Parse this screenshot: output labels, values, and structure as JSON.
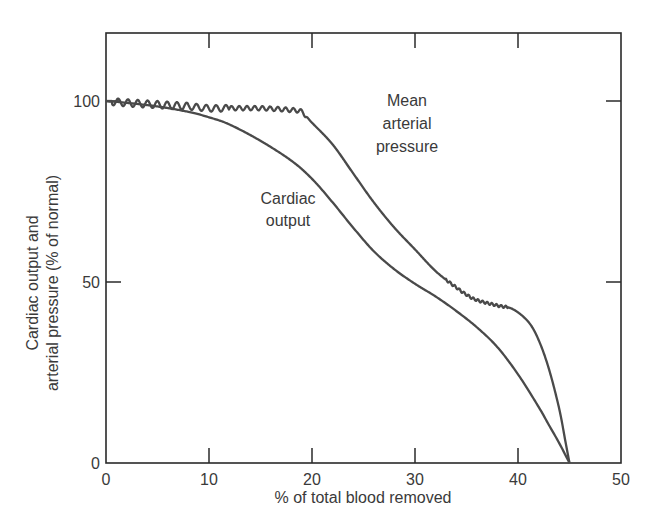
{
  "chart_data": {
    "type": "line",
    "title": "",
    "xlabel": "% of total blood removed",
    "ylabel": [
      "Cardiac output and",
      "arterial pressure (% of normal)"
    ],
    "xlim": [
      0,
      50
    ],
    "ylim": [
      0,
      120
    ],
    "x_ticks": [
      0,
      10,
      20,
      30,
      40,
      50
    ],
    "y_ticks": [
      0,
      50,
      100
    ],
    "x_tick_labels": [
      "0",
      "10",
      "20",
      "30",
      "40",
      "50"
    ],
    "y_tick_labels": [
      "0",
      "50",
      "100"
    ],
    "grid": false,
    "legend": "none (curves labeled directly)",
    "series": [
      {
        "name": "Mean arterial pressure",
        "label_lines": [
          "Mean",
          "arterial",
          "pressure"
        ],
        "style": "oscillating trace (pulsatile) at plateaus",
        "x": [
          0,
          2,
          5,
          8,
          10,
          12,
          15,
          18,
          19,
          20,
          22,
          24,
          26,
          28,
          30,
          32,
          34,
          35,
          36,
          38,
          39.5,
          41,
          42,
          43,
          44,
          44.6,
          45
        ],
        "y": [
          100,
          99.5,
          99,
          98.5,
          98,
          98,
          98,
          97.5,
          97,
          94,
          88,
          80,
          72,
          65,
          59,
          53,
          48.5,
          46.5,
          45,
          43.5,
          42.5,
          39,
          34,
          26,
          15,
          6,
          0
        ]
      },
      {
        "name": "Cardiac output",
        "label_lines": [
          "Cardiac",
          "output"
        ],
        "style": "smooth",
        "x": [
          0,
          2,
          5,
          8,
          10,
          12,
          15,
          18,
          20,
          22,
          24,
          26,
          28,
          30,
          32,
          34,
          36,
          38,
          40,
          42,
          43,
          44,
          45
        ],
        "y": [
          100,
          99.5,
          98.5,
          97,
          95.5,
          93.5,
          89,
          83.5,
          78.5,
          72,
          65,
          58.5,
          53.5,
          49.5,
          46,
          42,
          37.5,
          32,
          24.5,
          15.5,
          10.5,
          5.5,
          0
        ]
      }
    ]
  },
  "annotations": {
    "map_label": [
      "Mean",
      "arterial",
      "pressure"
    ],
    "co_label": [
      "Cardiac",
      "output"
    ]
  },
  "colors": {
    "line": "#4a4a4a",
    "axis": "#2a2a2a",
    "text": "#3a3a3a",
    "background": "#ffffff"
  }
}
